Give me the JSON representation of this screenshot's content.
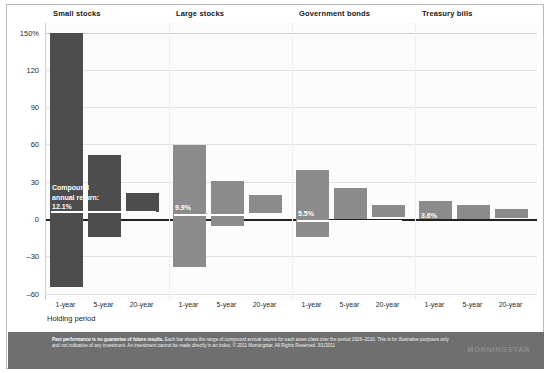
{
  "chart_data": {
    "type": "bar",
    "subtype": "floating-range-bar",
    "title": "",
    "xlabel": "Holding period",
    "ylabel": "",
    "ylim": [
      -60,
      150
    ],
    "yticks": [
      "150%",
      "120",
      "90",
      "60",
      "30",
      "0",
      "–30",
      "–60"
    ],
    "ytick_values": [
      150,
      120,
      90,
      60,
      30,
      0,
      -30,
      -60
    ],
    "grid": true,
    "legend": "none",
    "categories": [
      "1-year",
      "5-year",
      "20-year"
    ],
    "groups": [
      {
        "name": "Small stocks",
        "color": "#4d4d4d",
        "compound_annual_return": "12.1%",
        "compound_annual_return_value": 12.1,
        "bars": [
          {
            "period": "1-year",
            "high": 150,
            "low": -54
          },
          {
            "period": "5-year",
            "high": 52,
            "low": -14
          },
          {
            "period": "20-year",
            "high": 21,
            "low": 6
          }
        ]
      },
      {
        "name": "Large stocks",
        "color": "#8b8b8b",
        "compound_annual_return": "9.9%",
        "compound_annual_return_value": 9.9,
        "bars": [
          {
            "period": "1-year",
            "high": 60,
            "low": -38
          },
          {
            "period": "5-year",
            "high": 31,
            "low": -5
          },
          {
            "period": "20-year",
            "high": 20,
            "low": 5
          }
        ]
      },
      {
        "name": "Government bonds",
        "color": "#8b8b8b",
        "compound_annual_return": "5.5%",
        "compound_annual_return_value": 5.5,
        "bars": [
          {
            "period": "1-year",
            "high": 40,
            "low": -14
          },
          {
            "period": "5-year",
            "high": 25,
            "low": 0
          },
          {
            "period": "20-year",
            "high": 12,
            "low": 2
          }
        ]
      },
      {
        "name": "Treasury bills",
        "color": "#8b8b8b",
        "compound_annual_return": "3.6%",
        "compound_annual_return_value": 3.6,
        "bars": [
          {
            "period": "1-year",
            "high": 15,
            "low": 0
          },
          {
            "period": "5-year",
            "high": 12,
            "low": 0
          },
          {
            "period": "20-year",
            "high": 8,
            "low": 1
          }
        ]
      }
    ],
    "annotation": {
      "line1": "Compound",
      "line2": "annual return:",
      "line3": "12.1%"
    }
  },
  "xaxis": {
    "title": "Holding period",
    "ticks": [
      "1-year",
      "5-year",
      "20-year",
      "1-year",
      "5-year",
      "20-year",
      "1-year",
      "5-year",
      "20-year",
      "1-year",
      "5-year",
      "20-year"
    ]
  },
  "footer": {
    "lead": "Past performance is no guarantee of future results.",
    "body": " Each bar shows the range of compound annual returns for each asset class over the period 1926–2010. This is for illustrative purposes only and not indicative of any investment. An investment cannot be made directly in an index. © 2011 Morningstar. All Rights Reserved. 3/1/2011",
    "logo": "MORNINGSTAR"
  }
}
